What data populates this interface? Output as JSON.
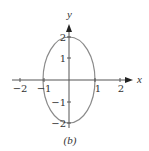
{
  "figure": {
    "caption": "(b)",
    "x_axis": {
      "label": "x",
      "ticks": [
        {
          "value": -2,
          "label": "−2"
        },
        {
          "value": -1,
          "label": "−1"
        },
        {
          "value": 1,
          "label": "1"
        },
        {
          "value": 2,
          "label": "2"
        }
      ]
    },
    "y_axis": {
      "label": "y",
      "ticks": [
        {
          "value": 2,
          "label": "2"
        },
        {
          "value": 1,
          "label": "1"
        },
        {
          "value": -1,
          "label": "−1"
        },
        {
          "value": -2,
          "label": "−2"
        }
      ]
    },
    "curve": {
      "type": "ellipse",
      "center": [
        0,
        0
      ],
      "semi_axis_x": 1,
      "semi_axis_y": 2,
      "equation": "x^2 + y^2/4 = 1",
      "stroke_color": "#8a8a8a"
    },
    "axis_color": "#444444"
  }
}
